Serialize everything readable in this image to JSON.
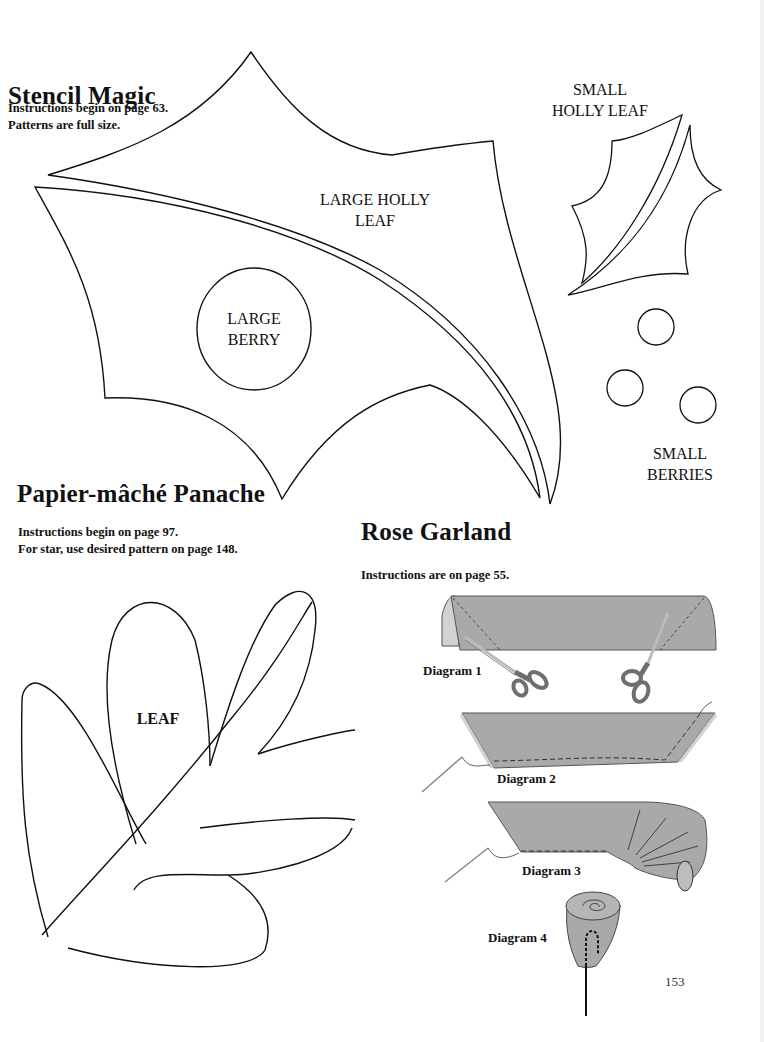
{
  "page": {
    "page_number": "153",
    "colors": {
      "outline": "#111111",
      "fabric": "#a9a9a9",
      "fabric_light": "#d2d2d2",
      "scissors_handle": "#6f6f6f"
    }
  },
  "stencil_magic": {
    "title": "Stencil Magic",
    "notes": [
      "Instructions begin on page 63.",
      "Patterns are full size."
    ],
    "patterns": {
      "large_holly_leaf": [
        "LARGE HOLLY",
        "LEAF"
      ],
      "large_berry": [
        "LARGE",
        "BERRY"
      ],
      "small_holly_leaf": [
        "SMALL",
        "HOLLY LEAF"
      ],
      "small_berries": [
        "SMALL",
        "BERRIES"
      ]
    }
  },
  "papier_mache": {
    "title": "Papier-mâché Panache",
    "notes": [
      "Instructions begin on page 97.",
      "For star, use desired pattern on page 148."
    ],
    "patterns": {
      "leaf": "LEAF"
    }
  },
  "rose_garland": {
    "title": "Rose Garland",
    "notes": [
      "Instructions are on page 55."
    ],
    "diagrams": [
      "Diagram 1",
      "Diagram 2",
      "Diagram 3",
      "Diagram 4"
    ]
  }
}
